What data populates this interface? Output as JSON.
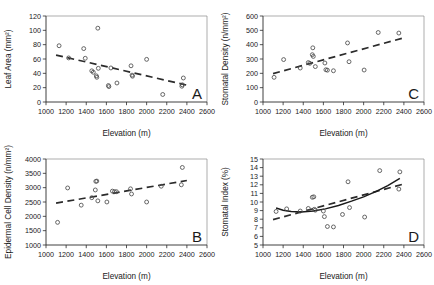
{
  "figure": {
    "name": "elevation-leaf-traits-figure",
    "shared_xlabel": "Elevation (m)",
    "xlim": [
      1000,
      2600
    ],
    "xticks": [
      1000,
      1200,
      1400,
      1600,
      1800,
      2000,
      2200,
      2400,
      2600
    ],
    "marker_color": "#4d4d4d",
    "fit_color": "#2b2b2b"
  },
  "chart_data": [
    {
      "id": "panel-a",
      "letter": "A",
      "type": "scatter",
      "title": "",
      "xlabel": "Elevation (m)",
      "ylabel": "Leaf Area (mm²)",
      "xlim": [
        1000,
        2600
      ],
      "ylim": [
        0,
        120
      ],
      "xticks": [
        1000,
        1200,
        1400,
        1600,
        1800,
        2000,
        2200,
        2400,
        2600
      ],
      "yticks": [
        0,
        20,
        40,
        60,
        80,
        100,
        120
      ],
      "grid": false,
      "legend": "none",
      "points": [
        {
          "x": 1130,
          "y": 78.5
        },
        {
          "x": 1225,
          "y": 61.5
        },
        {
          "x": 1375,
          "y": 74.5
        },
        {
          "x": 1390,
          "y": 61.0
        },
        {
          "x": 1455,
          "y": 43.5
        },
        {
          "x": 1470,
          "y": 41.5
        },
        {
          "x": 1500,
          "y": 36.5
        },
        {
          "x": 1505,
          "y": 34.5
        },
        {
          "x": 1515,
          "y": 103.0
        },
        {
          "x": 1520,
          "y": 47.0
        },
        {
          "x": 1620,
          "y": 23.0
        },
        {
          "x": 1625,
          "y": 21.5
        },
        {
          "x": 1645,
          "y": 47.5
        },
        {
          "x": 1705,
          "y": 26.5
        },
        {
          "x": 1845,
          "y": 50.5
        },
        {
          "x": 1855,
          "y": 37.5
        },
        {
          "x": 1860,
          "y": 36.0
        },
        {
          "x": 2000,
          "y": 59.5
        },
        {
          "x": 2160,
          "y": 10.5
        },
        {
          "x": 2350,
          "y": 22.0
        },
        {
          "x": 2355,
          "y": 24.0
        },
        {
          "x": 2365,
          "y": 33.5
        }
      ],
      "fits": [
        {
          "name": "linear-dashed",
          "style": "dashed",
          "x0": 1100,
          "y0": 65.5,
          "x1": 2400,
          "y1": 23.5
        }
      ]
    },
    {
      "id": "panel-b",
      "letter": "B",
      "type": "scatter",
      "title": "",
      "xlabel": "Elevation (m)",
      "ylabel": "Epidermal Cell Density (n/mm²)",
      "xlim": [
        1000,
        2600
      ],
      "ylim": [
        1000,
        4000
      ],
      "xticks": [
        1000,
        1200,
        1400,
        1600,
        1800,
        2000,
        2200,
        2400,
        2600
      ],
      "yticks": [
        1000,
        1500,
        2000,
        2500,
        3000,
        3500,
        4000
      ],
      "grid": false,
      "legend": "none",
      "points": [
        {
          "x": 1115,
          "y": 1790
        },
        {
          "x": 1215,
          "y": 2990
        },
        {
          "x": 1350,
          "y": 2390
        },
        {
          "x": 1455,
          "y": 2650
        },
        {
          "x": 1490,
          "y": 2920
        },
        {
          "x": 1495,
          "y": 3220
        },
        {
          "x": 1505,
          "y": 3230
        },
        {
          "x": 1515,
          "y": 2540
        },
        {
          "x": 1605,
          "y": 2500
        },
        {
          "x": 1660,
          "y": 2880
        },
        {
          "x": 1680,
          "y": 2860
        },
        {
          "x": 1700,
          "y": 2860
        },
        {
          "x": 1840,
          "y": 2960
        },
        {
          "x": 1850,
          "y": 2780
        },
        {
          "x": 2000,
          "y": 2500
        },
        {
          "x": 2145,
          "y": 3050
        },
        {
          "x": 2345,
          "y": 3100
        },
        {
          "x": 2355,
          "y": 3705
        }
      ],
      "fits": [
        {
          "name": "linear-dashed",
          "style": "dashed",
          "x0": 1100,
          "y0": 2460,
          "x1": 2400,
          "y1": 3250
        }
      ]
    },
    {
      "id": "panel-c",
      "letter": "C",
      "type": "scatter",
      "title": "",
      "xlabel": "Elevation (m)",
      "ylabel": "Stomatal Density (n/mm²)",
      "xlim": [
        1000,
        2600
      ],
      "ylim": [
        0,
        600
      ],
      "xticks": [
        1000,
        1200,
        1400,
        1600,
        1800,
        2000,
        2200,
        2400,
        2600
      ],
      "yticks": [
        0,
        100,
        200,
        300,
        400,
        500,
        600
      ],
      "grid": false,
      "legend": "none",
      "points": [
        {
          "x": 1110,
          "y": 172
        },
        {
          "x": 1205,
          "y": 296
        },
        {
          "x": 1370,
          "y": 237
        },
        {
          "x": 1450,
          "y": 275
        },
        {
          "x": 1465,
          "y": 270
        },
        {
          "x": 1490,
          "y": 330
        },
        {
          "x": 1495,
          "y": 378
        },
        {
          "x": 1500,
          "y": 318
        },
        {
          "x": 1520,
          "y": 247
        },
        {
          "x": 1615,
          "y": 272
        },
        {
          "x": 1625,
          "y": 225
        },
        {
          "x": 1640,
          "y": 222
        },
        {
          "x": 1700,
          "y": 218
        },
        {
          "x": 1840,
          "y": 412
        },
        {
          "x": 1855,
          "y": 281
        },
        {
          "x": 2005,
          "y": 223
        },
        {
          "x": 2145,
          "y": 485
        },
        {
          "x": 2350,
          "y": 481
        }
      ],
      "fits": [
        {
          "name": "linear-dashed",
          "style": "dashed",
          "x0": 1100,
          "y0": 198,
          "x1": 2400,
          "y1": 448
        }
      ]
    },
    {
      "id": "panel-d",
      "letter": "D",
      "type": "scatter",
      "title": "",
      "xlabel": "Elevation (m)",
      "ylabel": "Stomatal Index (%)",
      "xlim": [
        1000,
        2600
      ],
      "ylim": [
        5,
        15
      ],
      "xticks": [
        1000,
        1200,
        1400,
        1600,
        1800,
        2000,
        2200,
        2400,
        2600
      ],
      "yticks": [
        5,
        6,
        7,
        8,
        9,
        10,
        11,
        12,
        13,
        14,
        15
      ],
      "grid": false,
      "legend": "none",
      "points": [
        {
          "x": 1130,
          "y": 8.9
        },
        {
          "x": 1235,
          "y": 9.2
        },
        {
          "x": 1370,
          "y": 8.95
        },
        {
          "x": 1450,
          "y": 9.25
        },
        {
          "x": 1490,
          "y": 10.55
        },
        {
          "x": 1505,
          "y": 10.6
        },
        {
          "x": 1510,
          "y": 9.15
        },
        {
          "x": 1520,
          "y": 9.05
        },
        {
          "x": 1600,
          "y": 8.95
        },
        {
          "x": 1610,
          "y": 8.3
        },
        {
          "x": 1640,
          "y": 7.15
        },
        {
          "x": 1700,
          "y": 7.1
        },
        {
          "x": 1790,
          "y": 8.55
        },
        {
          "x": 1845,
          "y": 12.35
        },
        {
          "x": 1860,
          "y": 9.35
        },
        {
          "x": 2010,
          "y": 8.25
        },
        {
          "x": 2160,
          "y": 13.65
        },
        {
          "x": 2350,
          "y": 11.5
        },
        {
          "x": 2360,
          "y": 13.5
        }
      ],
      "fits": [
        {
          "name": "linear-dashed",
          "style": "dashed",
          "x0": 1100,
          "y0": 7.95,
          "x1": 2400,
          "y1": 12.1
        },
        {
          "name": "quadratic-solid",
          "style": "solid",
          "curve": [
            {
              "x": 1130,
              "y": 9.3
            },
            {
              "x": 1200,
              "y": 9.05
            },
            {
              "x": 1280,
              "y": 8.9
            },
            {
              "x": 1380,
              "y": 8.85
            },
            {
              "x": 1500,
              "y": 8.95
            },
            {
              "x": 1620,
              "y": 9.2
            },
            {
              "x": 1750,
              "y": 9.6
            },
            {
              "x": 1880,
              "y": 10.1
            },
            {
              "x": 2000,
              "y": 10.6
            },
            {
              "x": 2120,
              "y": 11.2
            },
            {
              "x": 2240,
              "y": 11.9
            },
            {
              "x": 2360,
              "y": 12.75
            }
          ]
        }
      ]
    }
  ]
}
